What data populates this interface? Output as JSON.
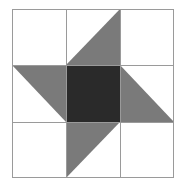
{
  "diagram": {
    "type": "quilt-block-pinwheel",
    "grid": {
      "rows": 3,
      "cols": 3
    },
    "colors": {
      "background": "#ffffff",
      "grid_line": "#9a9a9a",
      "triangle": "#7a7a7a",
      "center": "#2a2a2a"
    }
  }
}
